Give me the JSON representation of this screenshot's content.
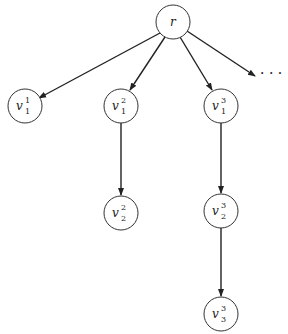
{
  "diagram": {
    "type": "tree",
    "root": {
      "id": "r",
      "label": "r",
      "cx": 173,
      "cy": 22
    },
    "nodes": [
      {
        "id": "v1_1",
        "base": "v",
        "sub": "1",
        "sup": "1",
        "cx": 25,
        "cy": 106
      },
      {
        "id": "v1_2",
        "base": "v",
        "sub": "1",
        "sup": "2",
        "cx": 121,
        "cy": 106
      },
      {
        "id": "v1_3",
        "base": "v",
        "sub": "1",
        "sup": "3",
        "cx": 221,
        "cy": 106
      },
      {
        "id": "v2_2",
        "base": "v",
        "sub": "2",
        "sup": "2",
        "cx": 121,
        "cy": 213
      },
      {
        "id": "v2_3",
        "base": "v",
        "sub": "2",
        "sup": "3",
        "cx": 221,
        "cy": 211
      },
      {
        "id": "v3_3",
        "base": "v",
        "sub": "3",
        "sup": "3",
        "cx": 221,
        "cy": 314
      }
    ],
    "edges": [
      {
        "from": "r",
        "to": "v1_1"
      },
      {
        "from": "r",
        "to": "v1_2"
      },
      {
        "from": "r",
        "to": "v1_3"
      },
      {
        "from": "r",
        "to": "ellipsis"
      },
      {
        "from": "v1_2",
        "to": "v2_2"
      },
      {
        "from": "v1_3",
        "to": "v2_3"
      },
      {
        "from": "v2_3",
        "to": "v3_3"
      }
    ],
    "ellipsis": {
      "text": "· · ·",
      "x": 262,
      "y": 75
    },
    "node_radius": 17,
    "stroke_color": "#333333"
  }
}
